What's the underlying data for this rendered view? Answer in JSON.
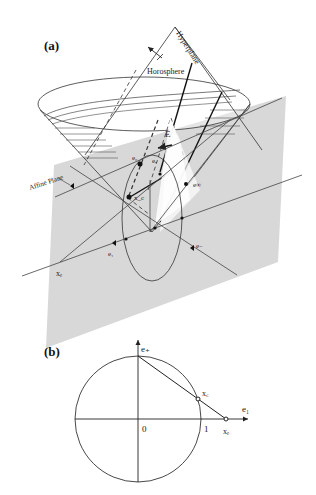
{
  "figure": {
    "panel_a": {
      "label": "(a)",
      "labels": {
        "hyperplane": "Hyperplane",
        "horosphere": "Horosphere",
        "affine_plane": "Affine Plane",
        "E": "E",
        "e0": "e₀",
        "ea": "eₐ",
        "xc": "x_c",
        "einf": "e∞",
        "e1": "e₁",
        "eminus": "e₋",
        "xe": "xₑ"
      }
    },
    "panel_b": {
      "label": "(b)",
      "labels": {
        "e_plus": "e₊",
        "e1": "e₁",
        "xc": "x꜀",
        "xe": "xₑ",
        "origin": "0",
        "one": "1"
      }
    },
    "colors": {
      "plane_fill": "#d6d6d6",
      "line": "#333333",
      "background": "#ffffff"
    }
  }
}
